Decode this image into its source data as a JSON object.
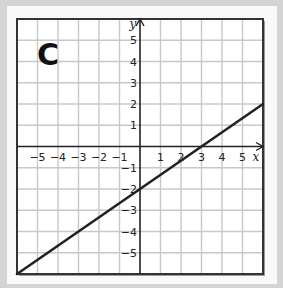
{
  "panel_label": "C",
  "chart_data": {
    "type": "line",
    "title": "C",
    "xlabel": "x",
    "ylabel": "y",
    "xlim": [
      -6,
      6
    ],
    "ylim": [
      -6,
      6
    ],
    "grid": true,
    "x_ticks": [
      "-5",
      "-4",
      "-3",
      "-2",
      "-1",
      "1",
      "2",
      "3",
      "4",
      "5"
    ],
    "y_ticks": [
      "5",
      "4",
      "3",
      "2",
      "1",
      "-1",
      "-2",
      "-3",
      "-4",
      "-5"
    ],
    "series": [
      {
        "name": "line",
        "equation": "y = (2/3)x - 2",
        "x": [
          -6,
          6
        ],
        "y": [
          -6,
          2
        ],
        "color": "#222222"
      }
    ]
  },
  "colors": {
    "background": "#d4d4d4",
    "card": "#f9f9f9",
    "grid": "#c8c8c8",
    "axis": "#222222",
    "line": "#222222"
  }
}
